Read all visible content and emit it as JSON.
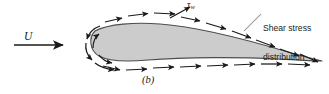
{
  "figure": {
    "kind": "airfoil-shear-stress-diagram",
    "subfigure_label": "(b)",
    "freestream_label": "U",
    "wall_shear_symbol": "τ",
    "wall_shear_subscript": "w",
    "annotation_line_1": "Shear stress",
    "annotation_line_2": "distribution",
    "colors": {
      "body_fill": "#cccccc",
      "outline": "#4d4d4d",
      "arrow": "#1a1a1a",
      "leader": "#808080",
      "background": "#ffffff",
      "text": "#1a1a1a"
    }
  }
}
